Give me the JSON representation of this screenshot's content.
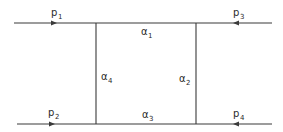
{
  "diagram": {
    "external_legs": [
      {
        "id": "p1",
        "base": "p",
        "sub": "1",
        "direction": "incoming-from-left"
      },
      {
        "id": "p2",
        "base": "p",
        "sub": "2",
        "direction": "incoming-from-left"
      },
      {
        "id": "p3",
        "base": "p",
        "sub": "3",
        "direction": "incoming-from-right"
      },
      {
        "id": "p4",
        "base": "p",
        "sub": "4",
        "direction": "incoming-from-right"
      }
    ],
    "internal_lines": [
      {
        "id": "a1",
        "base": "α",
        "sub": "1",
        "side": "top"
      },
      {
        "id": "a2",
        "base": "α",
        "sub": "2",
        "side": "right"
      },
      {
        "id": "a3",
        "base": "α",
        "sub": "3",
        "side": "bottom"
      },
      {
        "id": "a4",
        "base": "α",
        "sub": "4",
        "side": "left"
      }
    ]
  }
}
